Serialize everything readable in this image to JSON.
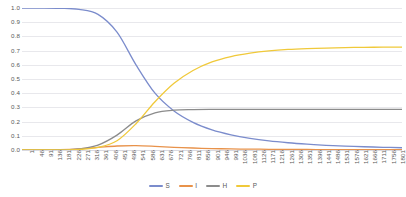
{
  "chart_data": {
    "type": "line",
    "title": "",
    "xlabel": "",
    "ylabel": "",
    "ylim": [
      0.0,
      1.0
    ],
    "xlim": [
      1,
      1801
    ],
    "grid": true,
    "legend_position": "bottom",
    "ytick_labels": [
      "1.0",
      "0.9",
      "0.8",
      "0.7",
      "0.6",
      "0.5",
      "0.4",
      "0.3",
      "0.2",
      "0.1",
      "0.0"
    ],
    "ytick_values": [
      1.0,
      0.9,
      0.8,
      0.7,
      0.6,
      0.5,
      0.4,
      0.3,
      0.2,
      0.1,
      0.0
    ],
    "xtick_labels": [
      "1",
      "46",
      "91",
      "136",
      "181",
      "226",
      "271",
      "316",
      "361",
      "406",
      "451",
      "496",
      "541",
      "586",
      "631",
      "676",
      "721",
      "766",
      "811",
      "856",
      "901",
      "946",
      "991",
      "1036",
      "1081",
      "1126",
      "1171",
      "1216",
      "1261",
      "1306",
      "1351",
      "1396",
      "1441",
      "1486",
      "1531",
      "1576",
      "1621",
      "1666",
      "1711",
      "1756",
      "1801"
    ],
    "x": [
      1,
      91,
      181,
      271,
      361,
      451,
      541,
      631,
      721,
      811,
      901,
      991,
      1081,
      1171,
      1261,
      1351,
      1441,
      1531,
      1621,
      1711,
      1801
    ],
    "series": [
      {
        "name": "S",
        "color": "#7b8ccc",
        "values": [
          1.0,
          1.0,
          0.998,
          0.99,
          0.955,
          0.83,
          0.6,
          0.4,
          0.275,
          0.195,
          0.142,
          0.107,
          0.082,
          0.064,
          0.051,
          0.041,
          0.033,
          0.027,
          0.023,
          0.019,
          0.016
        ]
      },
      {
        "name": "I",
        "color": "#e8924a",
        "values": [
          0.0,
          0.001,
          0.003,
          0.008,
          0.018,
          0.028,
          0.031,
          0.026,
          0.019,
          0.014,
          0.01,
          0.0075,
          0.006,
          0.005,
          0.004,
          0.0035,
          0.003,
          0.0027,
          0.0024,
          0.0022,
          0.002
        ]
      },
      {
        "name": "H",
        "color": "#8c8c8c",
        "values": [
          0.0,
          0.0,
          0.002,
          0.008,
          0.035,
          0.105,
          0.205,
          0.262,
          0.281,
          0.285,
          0.286,
          0.286,
          0.286,
          0.286,
          0.286,
          0.286,
          0.286,
          0.286,
          0.286,
          0.286,
          0.286
        ]
      },
      {
        "name": "P",
        "color": "#f0c93a",
        "values": [
          0.0,
          0.0,
          0.001,
          0.004,
          0.018,
          0.065,
          0.185,
          0.34,
          0.47,
          0.56,
          0.62,
          0.658,
          0.682,
          0.698,
          0.708,
          0.714,
          0.718,
          0.721,
          0.723,
          0.724,
          0.725
        ]
      }
    ]
  },
  "legend": {
    "items": [
      {
        "label": "S",
        "color": "#7b8ccc"
      },
      {
        "label": "I",
        "color": "#e8924a"
      },
      {
        "label": "H",
        "color": "#8c8c8c"
      },
      {
        "label": "P",
        "color": "#f0c93a"
      }
    ]
  }
}
